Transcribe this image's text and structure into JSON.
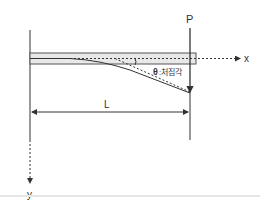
{
  "diagram": {
    "labels": {
      "load": "P",
      "x_axis": "x",
      "y_axis": "y",
      "length": "L",
      "theta_symbol": "θ",
      "theta_desc": ":처짐각"
    },
    "colors": {
      "line": "#333333",
      "beam_fill": "#e8e8e8",
      "beam_stroke": "#555555",
      "label_gray": "#888888"
    }
  }
}
